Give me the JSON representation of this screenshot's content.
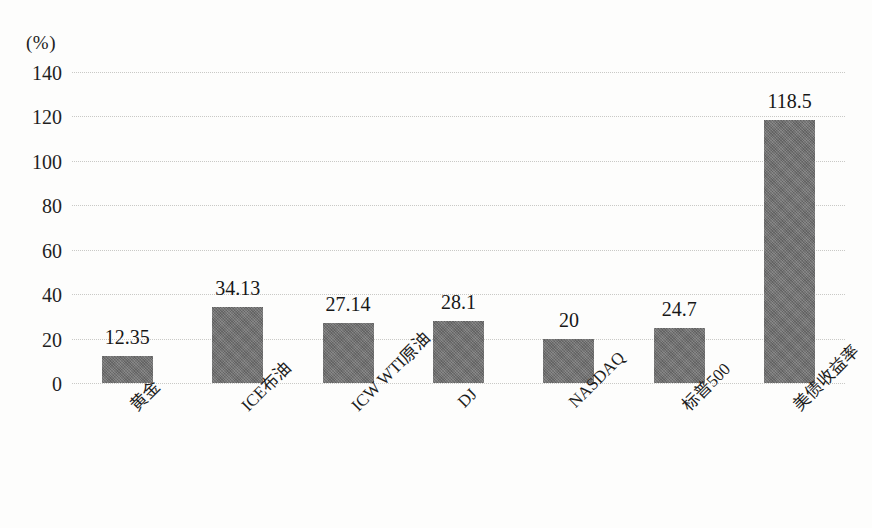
{
  "chart_data": {
    "type": "bar",
    "title": "",
    "subtitle": "",
    "xlabel": "",
    "ylabel": "(%)",
    "unit_caption": "(%)",
    "categories": [
      "黄金",
      "ICE布油",
      "ICW WTI原油",
      "DJ",
      "NASDAQ",
      "标普500",
      "美债收益率"
    ],
    "values": [
      12.35,
      34.13,
      27.14,
      28.1,
      20,
      24.7,
      118.5
    ],
    "value_labels": [
      "12.35",
      "34.13",
      "27.14",
      "28.1",
      "20",
      "24.7",
      "118.5"
    ],
    "ylim": [
      0,
      140
    ],
    "ytick_step": 20,
    "yticks": [
      140,
      120,
      100,
      80,
      60,
      40,
      20,
      0
    ],
    "ytick_labels": [
      "140",
      "120",
      "100",
      "80",
      "60",
      "40",
      "20",
      "0"
    ],
    "grid": true,
    "grid_style": "dotted",
    "legend": null,
    "legend_position": "none",
    "bar_color": "#6f6f6f",
    "grid_color": "#c9c9c6",
    "text_color": "#1b1b1b",
    "background_color": "#fdfdfc",
    "xlabel_rotation": -45
  }
}
